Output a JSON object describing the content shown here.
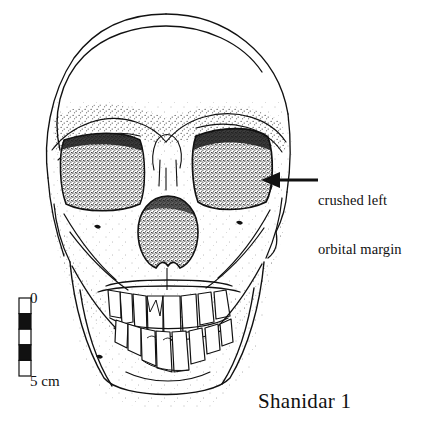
{
  "figure": {
    "kind": "line-drawing",
    "background_color": "#ffffff",
    "ink_color": "#111111"
  },
  "annotation": {
    "name": "crushed-left-orbital-margin",
    "line1": "crushed left",
    "line2": "orbital margin",
    "arrow": {
      "direction": "left",
      "tip_x": 261,
      "tip_y": 180,
      "tail_x": 318,
      "tail_y": 180
    }
  },
  "specimen": {
    "label": "Shanidar 1"
  },
  "scale_bar": {
    "orientation": "vertical",
    "top_label": "0",
    "bottom_label": "5 cm",
    "segments": [
      "white",
      "black",
      "white",
      "black",
      "white"
    ],
    "total_units": 5,
    "unit": "cm",
    "x": 19,
    "y": 298,
    "width": 12,
    "height": 78
  },
  "caption": {
    "ghost_text": ""
  }
}
